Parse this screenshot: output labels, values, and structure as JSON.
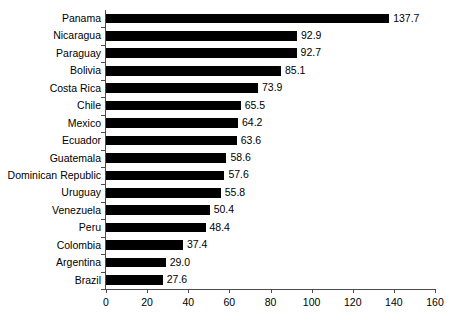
{
  "chart_data": {
    "type": "bar",
    "orientation": "horizontal",
    "title": "",
    "xlabel": "",
    "ylabel": "",
    "xlim": [
      0,
      160
    ],
    "xticks": [
      0,
      20,
      40,
      60,
      80,
      100,
      120,
      140,
      160
    ],
    "grid": false,
    "legend": false,
    "bar_color": "#000000",
    "axis_color": "#4d4d4d",
    "categories": [
      "Panama",
      "Nicaragua",
      "Paraguay",
      "Bolivia",
      "Costa Rica",
      "Chile",
      "Mexico",
      "Ecuador",
      "Guatemala",
      "Dominican Republic",
      "Uruguay",
      "Venezuela",
      "Peru",
      "Colombia",
      "Argentina",
      "Brazil"
    ],
    "values": [
      137.7,
      92.9,
      92.7,
      85.1,
      73.9,
      65.5,
      64.2,
      63.6,
      58.6,
      57.6,
      55.8,
      50.4,
      48.4,
      37.4,
      29.0,
      27.6
    ],
    "value_labels": [
      "137.7",
      "92.9",
      "92.7",
      "85.1",
      "73.9",
      "65.5",
      "64.2",
      "63.6",
      "58.6",
      "57.6",
      "55.8",
      "50.4",
      "48.4",
      "37.4",
      "29.0",
      "27.6"
    ]
  }
}
